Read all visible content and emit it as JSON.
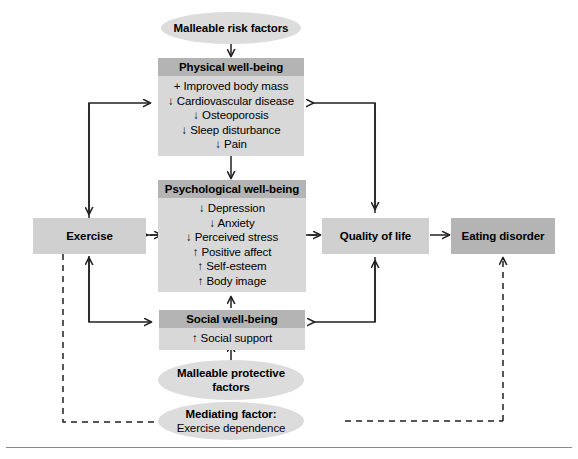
{
  "diagram": {
    "colors": {
      "header_gray": "#b4b4b4",
      "body_gray": "#d8d8d8",
      "plain_box_gray": "#d0d0d0",
      "dark_box_gray": "#b4b4b4",
      "ellipse_gray": "#dcdcdc",
      "line": "#231f20"
    }
  },
  "nodes": {
    "malleable_risk_factors": {
      "label": "Malleable risk factors",
      "shape": "ellipse"
    },
    "physical": {
      "title": "Physical well-being",
      "items": [
        "+ Improved body mass",
        "↓ Cardiovascular disease",
        "↓ Osteoporosis",
        "↓ Sleep disturbance",
        "↓ Pain"
      ]
    },
    "psychological": {
      "title": "Psychological well-being",
      "items": [
        "↓ Depression",
        "↓ Anxiety",
        "↓ Perceived stress",
        "↑ Positive affect",
        "↑ Self-esteem",
        "↑ Body image"
      ]
    },
    "social": {
      "title": "Social well-being",
      "items": [
        "↑ Social support"
      ]
    },
    "exercise": {
      "label": "Exercise"
    },
    "quality_of_life": {
      "label": "Quality of life"
    },
    "eating_disorder": {
      "label": "Eating disorder"
    },
    "malleable_protective_factors": {
      "line1": "Malleable protective",
      "line2": "factors",
      "shape": "ellipse"
    },
    "mediating_factor": {
      "line1": "Mediating factor:",
      "line2": "Exercise dependence",
      "shape": "ellipse"
    }
  }
}
